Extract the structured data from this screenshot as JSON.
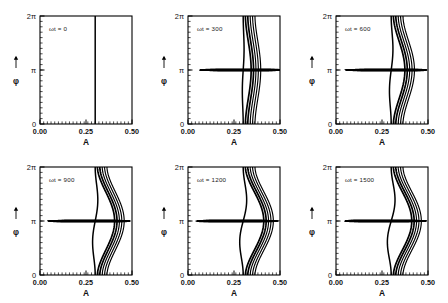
{
  "figure": {
    "background_color": "#ffffff",
    "line_color": "#000000",
    "rows": 2,
    "columns": 3,
    "xaxis": {
      "label": "A",
      "ticks": [
        "0.00",
        "0.25",
        "0.50"
      ],
      "tick_values": [
        0.0,
        0.25,
        0.5
      ],
      "range": [
        0.0,
        0.5
      ],
      "minor_tick_count": 25
    },
    "yaxis": {
      "label": "φ",
      "arrow": "up-arrow",
      "ticks": [
        "0",
        "π",
        "2π"
      ],
      "tick_values": [
        0,
        3.14159,
        6.28318
      ],
      "range": [
        0,
        6.28318
      ],
      "minor_tick_count": 20
    },
    "separatrix": {
      "description": "vertical line",
      "A_value": 0.3
    }
  },
  "chart_data": {
    "type": "line",
    "title": "",
    "xlabel": "A",
    "ylabel": "φ",
    "xlim": [
      0.0,
      0.5
    ],
    "ylim": [
      0,
      6.28318
    ],
    "grid": false,
    "legend_position": "none",
    "panel_count": 6,
    "panels": [
      {
        "index": 0,
        "label": "ωt = 0",
        "omega_t": 0,
        "xlabel": "A",
        "ylabel": "φ",
        "xticks": [
          "0.00",
          "0.25",
          "0.50"
        ],
        "yticks": [
          "0",
          "π",
          "2π"
        ],
        "description": "single straight vertical line at A = 0.30, no winding",
        "separatrix_A": 0.3,
        "spiral_turns": 0,
        "spiral_center": null,
        "contour_count": 1,
        "innermost_A": 0.3,
        "outermost_A": 0.3
      },
      {
        "index": 1,
        "label": "ωt = 300",
        "omega_t": 300,
        "xlabel": "A",
        "ylabel": "φ",
        "xticks": [
          "0.00",
          "0.25",
          "0.50"
        ],
        "yticks": [
          "0",
          "π",
          "2π"
        ],
        "description": "vertical line with short tendrils peeling off to the right above phi = pi and to the left below phi = pi",
        "separatrix_A": 0.3,
        "spiral_turns": 0.5,
        "spiral_center": {
          "A": 0.295,
          "phi": 3.14159
        },
        "contour_count": 11,
        "innermost_A": 0.22,
        "outermost_A": 0.4
      },
      {
        "index": 2,
        "label": "ωt = 600",
        "omega_t": 600,
        "xlabel": "A",
        "ylabel": "φ",
        "xticks": [
          "0.00",
          "0.25",
          "0.50"
        ],
        "yticks": [
          "0",
          "π",
          "2π"
        ],
        "description": "nested arcs wrapping around a forming island, bulging right near phi = 1.5 pi",
        "separatrix_A": 0.3,
        "spiral_turns": 1.0,
        "spiral_center": {
          "A": 0.285,
          "phi": 3.14159
        },
        "contour_count": 11,
        "innermost_A": 0.17,
        "outermost_A": 0.44
      },
      {
        "index": 3,
        "label": "ωt = 900",
        "omega_t": 900,
        "xlabel": "A",
        "ylabel": "φ",
        "xticks": [
          "0.00",
          "0.25",
          "0.50"
        ],
        "yticks": [
          "0",
          "π",
          "2π"
        ],
        "description": "well formed spiral with about one and a half turns, outer arms reach A = 0.11 on the left and A = 0.45 on the right",
        "separatrix_A": 0.3,
        "spiral_turns": 1.5,
        "spiral_center": {
          "A": 0.272,
          "phi": 3.14159
        },
        "contour_count": 11,
        "innermost_A": 0.11,
        "outermost_A": 0.45
      },
      {
        "index": 4,
        "label": "ωt = 1200",
        "omega_t": 1200,
        "xlabel": "A",
        "ylabel": "φ",
        "xticks": [
          "0.00",
          "0.25",
          "0.50"
        ],
        "yticks": [
          "0",
          "π",
          "2π"
        ],
        "description": "tight spiral of about two turns, outermost arm extends to A = 0.04",
        "separatrix_A": 0.3,
        "spiral_turns": 2.0,
        "spiral_center": {
          "A": 0.262,
          "phi": 3.14159
        },
        "contour_count": 11,
        "innermost_A": 0.04,
        "outermost_A": 0.45
      },
      {
        "index": 5,
        "label": "ωt = 1500",
        "omega_t": 1500,
        "xlabel": "A",
        "ylabel": "φ",
        "xticks": [
          "0.00",
          "0.25",
          "0.50"
        ],
        "yticks": [
          "0",
          "π",
          "2π"
        ],
        "description": "densely wound spiral of about two and a half turns with a closed innermost loop",
        "separatrix_A": 0.3,
        "spiral_turns": 2.6,
        "spiral_center": {
          "A": 0.258,
          "phi": 3.14159
        },
        "contour_count": 12,
        "innermost_A": 0.04,
        "outermost_A": 0.46
      }
    ]
  }
}
